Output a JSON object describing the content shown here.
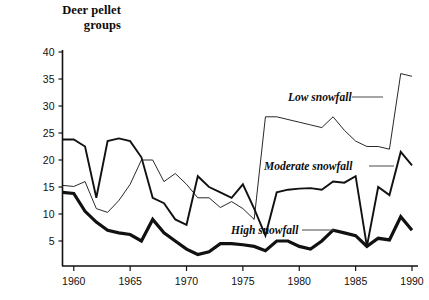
{
  "chart_data": {
    "type": "line",
    "title": "Deer pellet groups",
    "xlabel": "",
    "ylabel": "Deer pellet groups",
    "xlim": [
      1959,
      1990
    ],
    "ylim": [
      0,
      40
    ],
    "yticks": [
      5,
      10,
      15,
      20,
      25,
      30,
      35,
      40
    ],
    "xticks": [
      1960,
      1965,
      1970,
      1975,
      1980,
      1985,
      1990
    ],
    "grid": false,
    "legend_position": "inline-annotations",
    "x": [
      1959,
      1960,
      1961,
      1962,
      1963,
      1964,
      1965,
      1966,
      1967,
      1968,
      1969,
      1970,
      1971,
      1972,
      1973,
      1974,
      1975,
      1976,
      1977,
      1978,
      1979,
      1980,
      1981,
      1982,
      1983,
      1984,
      1985,
      1986,
      1987,
      1988,
      1989,
      1990
    ],
    "series": [
      {
        "name": "Low snowfall",
        "style": "thin",
        "values": [
          15.3,
          15.1,
          16.0,
          11.0,
          10.3,
          12.5,
          15.5,
          20.0,
          20.0,
          16.0,
          17.5,
          15.5,
          13.0,
          13.0,
          11.2,
          12.3,
          11.0,
          9.0,
          28.0,
          28.0,
          27.5,
          27.0,
          26.5,
          26.0,
          28.0,
          25.5,
          23.5,
          22.5,
          22.5,
          22.0,
          36.0,
          35.5
        ]
      },
      {
        "name": "Moderate snowfall",
        "style": "medium",
        "values": [
          23.8,
          23.8,
          22.5,
          13.0,
          23.5,
          24.0,
          23.5,
          20.5,
          13.0,
          12.0,
          9.0,
          8.0,
          17.0,
          15.0,
          14.0,
          13.0,
          15.5,
          11.0,
          6.0,
          14.0,
          14.5,
          14.7,
          14.8,
          14.5,
          16.0,
          15.8,
          17.0,
          4.0,
          15.0,
          13.5,
          21.5,
          19.0
        ]
      },
      {
        "name": "High snowfall",
        "style": "thick",
        "values": [
          14.0,
          13.8,
          10.5,
          8.5,
          7.0,
          6.5,
          6.2,
          5.0,
          9.0,
          6.5,
          5.0,
          3.5,
          2.5,
          3.0,
          4.5,
          4.5,
          4.3,
          4.0,
          3.2,
          5.0,
          5.0,
          4.0,
          3.5,
          5.0,
          7.0,
          6.5,
          6.0,
          4.0,
          5.5,
          5.2,
          9.5,
          7.0
        ]
      }
    ],
    "annotations": [
      {
        "label": "Low snowfall",
        "for_series": "Low snowfall"
      },
      {
        "label": "Moderate snowfall",
        "for_series": "Moderate snowfall"
      },
      {
        "label": "High snowfall",
        "for_series": "High snowfall"
      }
    ]
  },
  "axis": {
    "ytick_labels": [
      "40",
      "35",
      "30",
      "25",
      "20",
      "15",
      "10",
      "5"
    ],
    "xtick_labels": [
      "1960",
      "1965",
      "1970",
      "1975",
      "1980",
      "1985",
      "1990"
    ]
  },
  "title_lines": [
    "Deer pellet",
    "groups"
  ]
}
